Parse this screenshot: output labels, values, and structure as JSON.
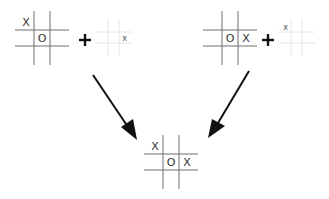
{
  "diagram": {
    "colors": {
      "grid": "#6e6e6e",
      "grid_faded": "#e6e6e6",
      "mark": "#333333",
      "arrow": "#111111"
    },
    "boards": {
      "left_state": {
        "cells": [
          "X",
          "",
          "",
          "",
          "O",
          "",
          "",
          "",
          ""
        ]
      },
      "left_move": {
        "cells": [
          "",
          "",
          "",
          "",
          "",
          "x",
          "",
          "",
          ""
        ]
      },
      "right_state": {
        "cells": [
          "",
          "",
          "",
          "",
          "O",
          "X",
          "",
          "",
          ""
        ]
      },
      "right_move": {
        "cells": [
          "x",
          "",
          "",
          "",
          "",
          "",
          "",
          "",
          ""
        ]
      },
      "result": {
        "cells": [
          "X",
          "",
          "",
          "",
          "O",
          "X",
          "",
          "",
          ""
        ]
      }
    },
    "operators": {
      "left_plus": "+",
      "right_plus": "+"
    }
  }
}
